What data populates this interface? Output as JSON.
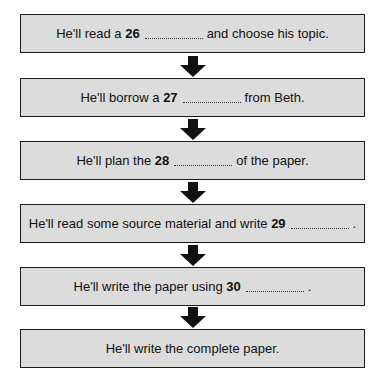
{
  "flowchart": {
    "steps": [
      {
        "before": "He'll read a ",
        "number": "26",
        "after": "and choose his topic."
      },
      {
        "before": "He'll borrow a ",
        "number": "27",
        "after": "from Beth."
      },
      {
        "before": "He'll plan the ",
        "number": "28",
        "after": "of the paper."
      },
      {
        "before": "He'll read some source material and write ",
        "number": "29",
        "after": "."
      },
      {
        "before": "He'll write the paper using ",
        "number": "30",
        "after": "."
      },
      {
        "text": "He'll write the complete paper."
      }
    ],
    "colors": {
      "box_fill": "#dcdcdc",
      "border": "#1a1a1a",
      "arrow": "#111111"
    }
  }
}
